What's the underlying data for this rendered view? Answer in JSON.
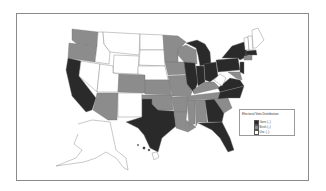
{
  "map": {
    "title": "Electoral Vote Distribution",
    "colors": {
      "gore": "#2a2a2a",
      "bush": "#8c8c8c",
      "undecided": "#ffffff",
      "border": "#777777"
    }
  },
  "legend": {
    "title": "Electoral Vote Distribution",
    "entries": [
      {
        "label": "Gore (..)",
        "color": "#2a2a2a"
      },
      {
        "label": "Bush (..)",
        "color": "#8c8c8c"
      },
      {
        "label": "Unc (..)",
        "color": "#ffffff"
      }
    ]
  }
}
